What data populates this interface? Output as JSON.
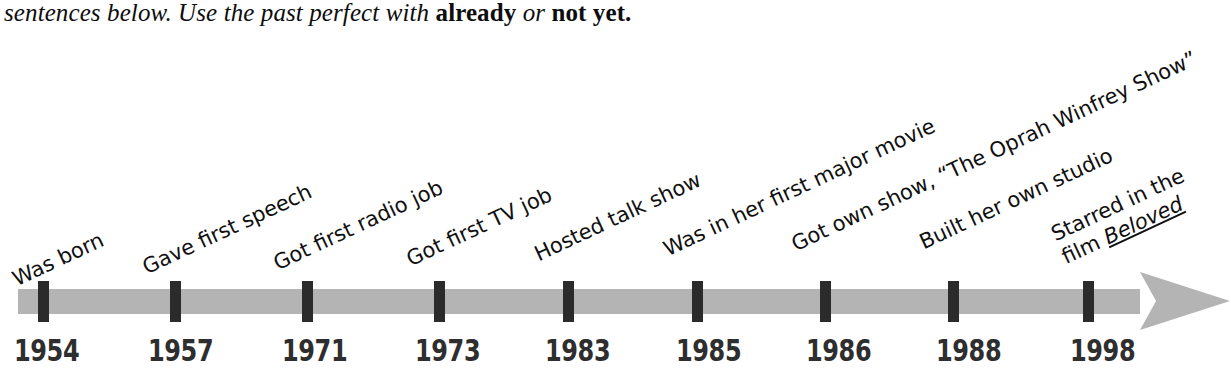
{
  "instruction": {
    "lead": "sentences below. Use the past perfect with ",
    "term_one": "already",
    "conjunction": " or ",
    "term_two": "not yet",
    "period": "."
  },
  "colors": {
    "bar": "#b4b4b4",
    "tick": "#2b2b2b",
    "text": "#101010",
    "year_text": "#2e2e2e",
    "background": "#ffffff"
  },
  "timeline": {
    "axis_direction": "left-to-right",
    "arrow_head": "right-arrow",
    "events": [
      {
        "year": "1954",
        "label": "Was born",
        "tick_x": 38,
        "label_x": 14,
        "label_y": 268
      },
      {
        "year": "1957",
        "label": "Gave first speech",
        "tick_x": 170,
        "label_x": 144,
        "label_y": 256
      },
      {
        "year": "1971",
        "label": "Got first radio job",
        "tick_x": 302,
        "label_x": 275,
        "label_y": 252
      },
      {
        "year": "1973",
        "label": "Got first TV job",
        "tick_x": 434,
        "label_x": 408,
        "label_y": 248
      },
      {
        "year": "1983",
        "label": "Hosted talk show",
        "tick_x": 563,
        "label_x": 536,
        "label_y": 243
      },
      {
        "year": "1985",
        "label": "Was in her first major movie",
        "tick_x": 692,
        "label_x": 665,
        "label_y": 238
      },
      {
        "year": "1986",
        "label": "Got own show, “The Oprah Winfrey Show”",
        "tick_x": 820,
        "label_x": 793,
        "label_y": 233
      },
      {
        "year": "1988",
        "label": "Built her own studio",
        "tick_x": 948,
        "label_x": 921,
        "label_y": 231
      },
      {
        "year": "1998",
        "label": "Starred in the",
        "label_line2": "film ",
        "label_line2_italic": "Beloved",
        "tick_x": 1083,
        "label_x": 1058,
        "label_y": 222
      }
    ],
    "year_positions": [
      14,
      148,
      282,
      415,
      545,
      676,
      806,
      936,
      1070
    ]
  }
}
